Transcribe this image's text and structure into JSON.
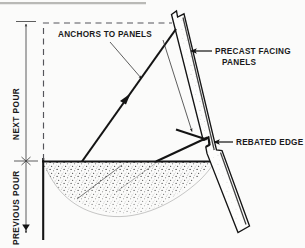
{
  "figure": {
    "background_color": "#fbfbfa",
    "ink_color": "#141414"
  },
  "labels": {
    "anchors": "ANCHORS TO PANELS",
    "precast_line1": "PRECAST FACING",
    "precast_line2": "PANELS",
    "rebated": "REBATED EDGE",
    "next_pour": "NEXT POUR",
    "previous_pour": "PREVIOUS POUR"
  },
  "dimension_stack": {
    "upper_label": "NEXT POUR",
    "lower_label": "PREVIOUS POUR",
    "divider_marker": "cross-tick",
    "upper_arrow": "single-arrow-up",
    "lower_arrow": "double-arrow-down"
  },
  "leaders": {
    "precast_arrow": "arrow-left",
    "rebated_arrow": "arrow-left",
    "anchor_arrow_upper": "arrow-down-right",
    "anchor_arrow_lower": "arrow-down-right"
  },
  "elements": {
    "panel_name": "precast-facing-panel",
    "anchor_upper_name": "anchor-upper",
    "anchor_lower_name": "anchor-lower",
    "rebate_name": "rebated-edge-notch",
    "previous_pour_concrete": "previous-pour-concrete",
    "form_line_name": "next-pour-form-line"
  }
}
